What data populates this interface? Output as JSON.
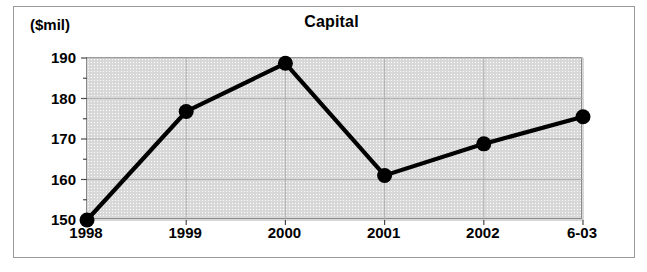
{
  "figure": {
    "unit_label": "($mil)",
    "title": "Capital"
  },
  "chart_data": {
    "type": "line",
    "title": "Capital",
    "xlabel": "",
    "ylabel": "($mil)",
    "ylim": [
      150,
      190
    ],
    "y_ticks": [
      150,
      160,
      170,
      180,
      190
    ],
    "y_minor_tick_step": 5,
    "grid": true,
    "legend": "none",
    "categories": [
      "1998",
      "1999",
      "2000",
      "2001",
      "2002",
      "6-03"
    ],
    "series": [
      {
        "name": "Capital",
        "values": [
          150.0,
          176.8,
          188.7,
          161.0,
          168.8,
          175.5
        ],
        "color": "#000000",
        "marker": "circle"
      }
    ]
  },
  "axes": {
    "y_tick_labels": [
      "190",
      "180",
      "170",
      "160",
      "150"
    ],
    "x_tick_labels": [
      "1998",
      "1999",
      "2000",
      "2001",
      "2002",
      "6-03"
    ]
  },
  "colors": {
    "plot_background": "#d8d8d8",
    "series": "#000000",
    "frame": "#9a9a9a",
    "gridline": "#b0b0b0"
  }
}
